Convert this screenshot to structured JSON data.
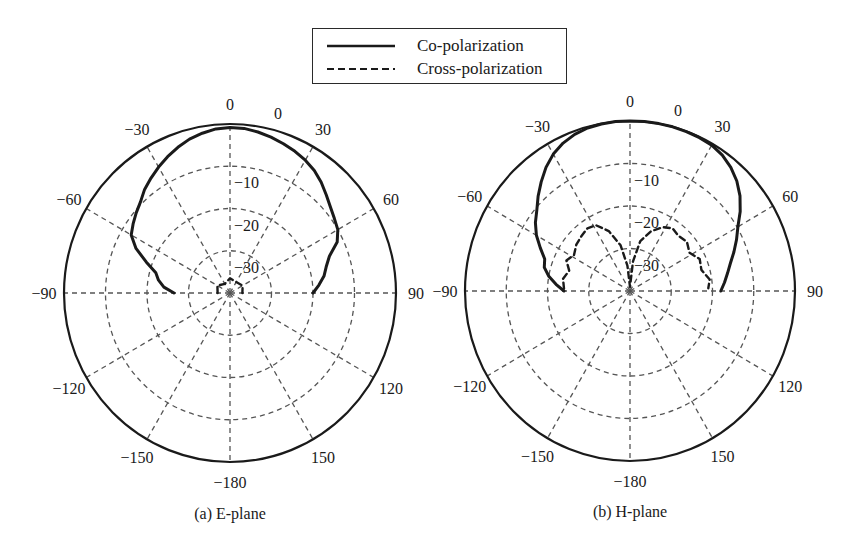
{
  "chart_data": [
    {
      "type": "polar-line",
      "title": "(a) E-plane",
      "radial_axis": {
        "range": [
          -40,
          0
        ],
        "unit": "dB",
        "tick_labels": [
          "0",
          "-10",
          "-20",
          "-30"
        ],
        "ticks": [
          0,
          -10,
          -20,
          -30
        ]
      },
      "angular_axis": {
        "zero_direction": "top",
        "direction": "clockwise",
        "tick_values": [
          0,
          30,
          60,
          90,
          120,
          150,
          180,
          -150,
          -120,
          -90,
          -60,
          -30
        ],
        "tick_labels": [
          "0",
          "30",
          "60",
          "90",
          "120",
          "150",
          "−180",
          "−150",
          "−120",
          "−90",
          "−60",
          "−30"
        ]
      },
      "grid": true,
      "series": [
        {
          "name": "Co-polarization",
          "style": "solid",
          "theta": [
            -90,
            -85,
            -80,
            -75,
            -70,
            -65,
            -60,
            -55,
            -50,
            -45,
            -40,
            -35,
            -30,
            -25,
            -20,
            -15,
            -10,
            -5,
            0,
            5,
            10,
            15,
            20,
            25,
            30,
            35,
            40,
            45,
            50,
            55,
            60,
            65,
            70,
            75,
            80,
            85,
            90
          ],
          "r": [
            -26.5,
            -24,
            -22.5,
            -21.5,
            -18.5,
            -15,
            -12.5,
            -11.5,
            -10.5,
            -9.5,
            -8,
            -6.8,
            -5.6,
            -4.4,
            -3.3,
            -2.3,
            -1.6,
            -1.0,
            -0.8,
            -0.9,
            -1.3,
            -1.8,
            -2.4,
            -3.0,
            -3.7,
            -4.6,
            -5.8,
            -7.2,
            -8.4,
            -9.3,
            -10.0,
            -11.5,
            -14.5,
            -16.0,
            -17.0,
            -18.5,
            -20.0
          ]
        },
        {
          "name": "Cross-polarization",
          "style": "dashed",
          "theta": [
            -90,
            -60,
            -30,
            0,
            30,
            60,
            90
          ],
          "r": [
            -37,
            -36.5,
            -37.5,
            -36.5,
            -37,
            -36.5,
            -37
          ]
        }
      ]
    },
    {
      "type": "polar-line",
      "title": "(b) H-plane",
      "radial_axis": {
        "range": [
          -40,
          0
        ],
        "unit": "dB",
        "tick_labels": [
          "0",
          "-10",
          "-20",
          "-30"
        ],
        "ticks": [
          0,
          -10,
          -20,
          -30
        ]
      },
      "angular_axis": {
        "zero_direction": "top",
        "direction": "clockwise",
        "tick_values": [
          0,
          30,
          60,
          90,
          120,
          150,
          180,
          -150,
          -120,
          -90,
          -60,
          -30
        ],
        "tick_labels": [
          "0",
          "30",
          "60",
          "90",
          "120",
          "150",
          "−180",
          "−150",
          "−120",
          "−90",
          "−60",
          "−30"
        ]
      },
      "grid": true,
      "series": [
        {
          "name": "Co-polarization",
          "style": "solid",
          "theta": [
            -90,
            -85,
            -80,
            -75,
            -70,
            -65,
            -60,
            -55,
            -50,
            -45,
            -40,
            -35,
            -30,
            -25,
            -20,
            -15,
            -10,
            -5,
            0,
            5,
            10,
            15,
            20,
            25,
            30,
            35,
            40,
            45,
            50,
            55,
            60,
            65,
            70,
            75,
            80,
            85,
            90
          ],
          "r": [
            -24,
            -22,
            -20,
            -18.5,
            -18,
            -16,
            -13.8,
            -12,
            -10.5,
            -8.5,
            -6.5,
            -4.5,
            -2.8,
            -1.6,
            -0.8,
            -0.3,
            -0.1,
            0,
            0,
            0,
            0,
            0,
            -0.1,
            -0.2,
            -0.4,
            -1.0,
            -2.0,
            -3.4,
            -5.2,
            -7.4,
            -9.8,
            -11.5,
            -13.2,
            -14.8,
            -16,
            -17,
            -18
          ]
        },
        {
          "name": "Cross-polarization",
          "style": "dashed",
          "theta": [
            -88,
            -80,
            -72,
            -65,
            -58,
            -50,
            -42,
            -35,
            -28,
            -20,
            -12,
            -6,
            0,
            6,
            12,
            20,
            28,
            35,
            42,
            50,
            58,
            66,
            74,
            82,
            88
          ],
          "r": [
            -24,
            -23.5,
            -24.5,
            -23,
            -24,
            -23,
            -22.5,
            -22,
            -22.5,
            -25,
            -29,
            -34,
            -39,
            -33,
            -28,
            -25,
            -23,
            -22,
            -22.5,
            -22,
            -23,
            -21.5,
            -22,
            -20.5,
            -21
          ]
        }
      ]
    }
  ],
  "legend": {
    "placement": "top-center",
    "items": [
      {
        "label": "Co-polarization",
        "style": "solid"
      },
      {
        "label": "Cross-polarization",
        "style": "dashed"
      }
    ]
  },
  "colors": {
    "line": "#1a1a1a",
    "grid": "#555555",
    "outer": "#1a1a1a"
  }
}
